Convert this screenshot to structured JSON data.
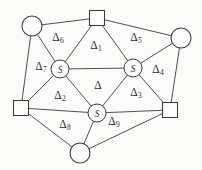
{
  "figure": {
    "type": "planar-triangulation-graph",
    "title": "",
    "background_color": "#fbfbfa",
    "ink_color": "#3a3a3f"
  },
  "nodes": [
    {
      "id": "n-top-left",
      "name": "circle-node-top-left",
      "shape": "circle",
      "label": "",
      "cx": 32,
      "cy": 26,
      "r": 10
    },
    {
      "id": "n-top",
      "name": "square-node-top",
      "shape": "square",
      "label": "",
      "cx": 97,
      "cy": 18,
      "size": 15
    },
    {
      "id": "n-top-right",
      "name": "circle-node-top-right",
      "shape": "circle",
      "label": "",
      "cx": 181,
      "cy": 38,
      "r": 10
    },
    {
      "id": "n-left",
      "name": "square-node-left",
      "shape": "square",
      "label": "",
      "cx": 21,
      "cy": 108,
      "size": 15
    },
    {
      "id": "n-right",
      "name": "square-node-right",
      "shape": "square",
      "label": "",
      "cx": 170,
      "cy": 110,
      "size": 15
    },
    {
      "id": "n-bottom",
      "name": "circle-node-bottom",
      "shape": "circle",
      "label": "",
      "cx": 80,
      "cy": 153,
      "r": 10
    },
    {
      "id": "n-steiner-left",
      "name": "steiner-node-left",
      "shape": "circle",
      "label": "S",
      "cx": 60,
      "cy": 69,
      "r": 9
    },
    {
      "id": "n-steiner-right",
      "name": "steiner-node-right",
      "shape": "circle",
      "label": "S",
      "cx": 133,
      "cy": 68,
      "r": 9
    },
    {
      "id": "n-steiner-bottom",
      "name": "steiner-node-bottom-center",
      "shape": "circle",
      "label": "S",
      "cx": 97,
      "cy": 113,
      "r": 9
    }
  ],
  "edges": [
    {
      "from": "n-top-left",
      "to": "n-top"
    },
    {
      "from": "n-top",
      "to": "n-top-right"
    },
    {
      "from": "n-top-left",
      "to": "n-left"
    },
    {
      "from": "n-top-right",
      "to": "n-right"
    },
    {
      "from": "n-left",
      "to": "n-bottom"
    },
    {
      "from": "n-right",
      "to": "n-bottom"
    },
    {
      "from": "n-top-left",
      "to": "n-steiner-left"
    },
    {
      "from": "n-top",
      "to": "n-steiner-left"
    },
    {
      "from": "n-top",
      "to": "n-steiner-right"
    },
    {
      "from": "n-top-right",
      "to": "n-steiner-right"
    },
    {
      "from": "n-left",
      "to": "n-steiner-left"
    },
    {
      "from": "n-right",
      "to": "n-steiner-right"
    },
    {
      "from": "n-steiner-left",
      "to": "n-steiner-right"
    },
    {
      "from": "n-steiner-left",
      "to": "n-steiner-bottom"
    },
    {
      "from": "n-steiner-right",
      "to": "n-steiner-bottom"
    },
    {
      "from": "n-left",
      "to": "n-steiner-bottom"
    },
    {
      "from": "n-right",
      "to": "n-steiner-bottom"
    },
    {
      "from": "n-bottom",
      "to": "n-steiner-bottom"
    }
  ],
  "regions": [
    {
      "key": "d1",
      "symbol": "Δ",
      "subscript": "1",
      "x": 96,
      "y": 46
    },
    {
      "key": "d2",
      "symbol": "Δ",
      "subscript": "2",
      "x": 60,
      "y": 96
    },
    {
      "key": "d3",
      "symbol": "Δ",
      "subscript": "3",
      "x": 136,
      "y": 93
    },
    {
      "key": "d4",
      "symbol": "Δ",
      "subscript": "4",
      "x": 158,
      "y": 70
    },
    {
      "key": "d5",
      "symbol": "Δ",
      "subscript": "5",
      "x": 136,
      "y": 38
    },
    {
      "key": "d6",
      "symbol": "Δ",
      "subscript": "6",
      "x": 58,
      "y": 38
    },
    {
      "key": "d7",
      "symbol": "Δ",
      "subscript": "7",
      "x": 41,
      "y": 67
    },
    {
      "key": "d8",
      "symbol": "Δ",
      "subscript": "8",
      "x": 65,
      "y": 125
    },
    {
      "key": "d9",
      "symbol": "Δ",
      "subscript": "9",
      "x": 114,
      "y": 122
    },
    {
      "key": "d0",
      "symbol": "Δ",
      "subscript": "",
      "x": 98,
      "y": 86
    }
  ]
}
